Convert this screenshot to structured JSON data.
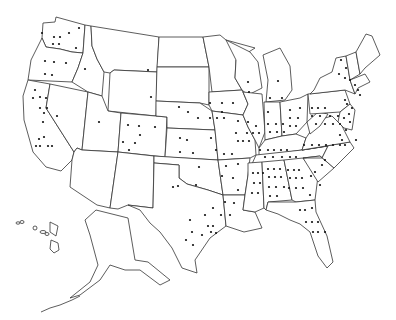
{
  "map": {
    "title": "",
    "type": "United States state outline map with dot markers",
    "outline_color": "#333333",
    "dot_color": "#111111",
    "background": "#ffffff",
    "states": [
      {
        "name": "Washington",
        "points": "43,23 55,22 56,17 85,25 83,53 72,52 60,49 46,47 42,38"
      },
      {
        "name": "Oregon",
        "points": "42,38 46,47 60,49 72,52 83,53 78,68 72,82 28,80 31,60"
      },
      {
        "name": "California",
        "points": "28,80 50,84 46,108 74,152 72,160 61,171 46,167 33,152 24,120 23,96"
      },
      {
        "name": "Nevada",
        "points": "50,84 88,92 82,150 77,148 74,152 46,108"
      },
      {
        "name": "Idaho",
        "points": "85,25 91,26 92,46 97,59 104,72 102,96 88,92 72,82 78,68 83,53"
      },
      {
        "name": "Montana",
        "points": "91,26 159,37 157,72 114,70 110,73 104,72 97,59 92,46"
      },
      {
        "name": "Wyoming",
        "points": "114,70 157,72 156,116 108,111 110,73"
      },
      {
        "name": "Utah",
        "points": "88,92 102,96 108,111 121,113 118,152 82,150"
      },
      {
        "name": "Colorado",
        "points": "121,113 167,117 165,157 118,152"
      },
      {
        "name": "Arizona",
        "points": "82,150 118,152 110,208 97,205 70,187 72,160 74,152 77,148"
      },
      {
        "name": "New Mexico",
        "points": "118,152 154,156 153,208 128,205 118,209 110,208"
      },
      {
        "name": "North Dakota",
        "points": "159,37 203,37 209,67 157,67"
      },
      {
        "name": "South Dakota",
        "points": "157,67 209,67 209,105 200,103 156,101"
      },
      {
        "name": "Nebraska",
        "points": "156,101 200,103 212,111 215,130 167,128 167,117 156,116"
      },
      {
        "name": "Kansas",
        "points": "167,128 215,130 218,160 165,157"
      },
      {
        "name": "Oklahoma",
        "points": "154,156 218,160 223,195 208,190 187,184 179,178 179,165 154,163"
      },
      {
        "name": "Texas",
        "points": "154,163 179,165 179,178 187,184 208,190 223,195 226,226 210,238 195,260 197,273 182,268 172,248 160,232 150,223 140,210 128,205 153,208"
      },
      {
        "name": "Minnesota",
        "points": "203,37 220,35 226,40 255,48 236,60 235,78 242,90 212,92 209,67"
      },
      {
        "name": "Iowa",
        "points": "209,92 242,90 248,104 243,115 212,111 209,105"
      },
      {
        "name": "Missouri",
        "points": "212,111 243,115 248,127 255,140 256,155 250,158 218,160 215,130"
      },
      {
        "name": "Arkansas",
        "points": "218,160 250,158 248,175 245,195 223,195"
      },
      {
        "name": "Louisiana",
        "points": "223,195 245,195 243,210 255,212 262,228 244,232 226,226"
      },
      {
        "name": "Wisconsin",
        "points": "226,40 250,52 258,62 262,88 248,95 242,90 235,78 236,60"
      },
      {
        "name": "Illinois",
        "points": "243,92 262,94 265,132 259,148 255,140 248,127 243,115 248,104"
      },
      {
        "name": "Michigan",
        "points": "263,55 280,48 290,66 292,90 285,100 266,102 268,80"
      },
      {
        "name": "Indiana",
        "points": "264,102 280,102 282,136 265,140"
      },
      {
        "name": "Ohio",
        "points": "280,102 300,98 308,94 307,122 296,134 282,136"
      },
      {
        "name": "Kentucky",
        "points": "259,148 265,140 282,136 296,134 306,138 302,150 259,156"
      },
      {
        "name": "Tennessee",
        "points": "256,155 302,150 328,146 322,158 252,164"
      },
      {
        "name": "Mississippi",
        "points": "248,163 262,162 264,208 255,212 243,210 245,195 248,175"
      },
      {
        "name": "Alabama",
        "points": "262,162 284,160 292,200 268,202 266,210 264,208"
      },
      {
        "name": "Georgia",
        "points": "284,160 303,158 318,176 315,200 296,202 292,200"
      },
      {
        "name": "Florida",
        "points": "266,210 268,202 296,202 315,200 316,212 327,236 333,262 327,268 318,256 310,232 300,224 290,220 278,214"
      },
      {
        "name": "South Carolina",
        "points": "303,158 320,156 334,168 318,182"
      },
      {
        "name": "North Carolina",
        "points": "302,150 350,142 354,148 340,162 334,168 320,156 303,158 322,158 328,146"
      },
      {
        "name": "Virginia",
        "points": "306,138 318,120 332,116 342,126 350,142 302,150"
      },
      {
        "name": "West Virginia",
        "points": "307,122 318,112 328,114 320,126 310,134"
      },
      {
        "name": "Pennsylvania",
        "points": "308,94 345,90 350,104 340,112 310,114"
      },
      {
        "name": "New York",
        "points": "314,90 320,78 332,72 336,58 346,56 350,80 355,94 345,90 310,94"
      },
      {
        "name": "Maryland/Delaware/NJ",
        "points": "340,112 350,104 355,110 352,130 344,128 338,122"
      },
      {
        "name": "Vermont/New Hampshire",
        "points": "346,56 356,52 360,74 350,80"
      },
      {
        "name": "Maine",
        "points": "356,52 366,34 372,36 380,55 365,68 360,74"
      },
      {
        "name": "Massachusetts/CT/RI",
        "points": "350,80 365,74 370,82 358,88 355,94"
      }
    ],
    "territories": [
      {
        "name": "Alaska",
        "points": "96,210 108,213 128,218 135,260 148,262 170,280 160,285 140,270 125,270 110,265 100,280 80,295 70,298 90,282 98,265 94,250 90,235 85,220"
      },
      {
        "name": "Hawaii",
        "points": "50,222 58,226 56,236 50,232"
      }
    ]
  }
}
